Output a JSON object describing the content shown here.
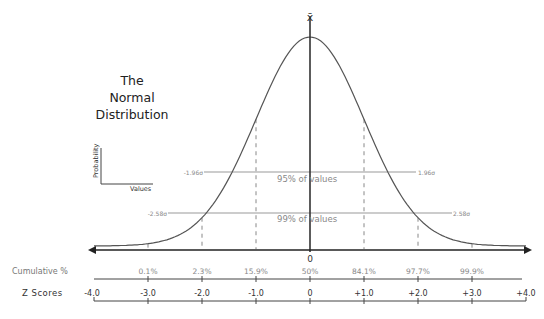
{
  "title": {
    "line1": "The",
    "line2": "Normal",
    "line3": "Distribution"
  },
  "legend": {
    "y_label": "Probability",
    "x_label": "Values"
  },
  "mean_symbol": "x̄",
  "center_label": "0",
  "intervals": {
    "inner": {
      "label": "95% of values",
      "left": "-1.96σ",
      "right": "1.96σ"
    },
    "outer": {
      "label": "99% of values",
      "left": "-2.58σ",
      "right": "2.58σ"
    }
  },
  "rows": {
    "cumulative_label": "Cumulative %",
    "z_label": "Z Scores"
  },
  "chart_data": {
    "type": "line",
    "title": "The Normal Distribution",
    "xlabel": "Values",
    "ylabel": "Probability",
    "x": [
      -4.0,
      -3.0,
      -2.0,
      -1.0,
      0,
      1.0,
      2.0,
      3.0,
      4.0
    ],
    "z_score_labels": [
      "-4.0",
      "-3.0",
      "-2.0",
      "-1.0",
      "0",
      "+1.0",
      "+2.0",
      "+3.0",
      "+4.0"
    ],
    "cumulative_percent": {
      "z": [
        -3.0,
        -2.0,
        -1.0,
        0,
        1.0,
        2.0,
        3.0
      ],
      "labels": [
        "0.1%",
        "2.3%",
        "15.9%",
        "50%",
        "84.1%",
        "97.7%",
        "99.9%"
      ]
    },
    "annotations": [
      {
        "text": "95% of values",
        "range": [
          "-1.96σ",
          "1.96σ"
        ]
      },
      {
        "text": "99% of values",
        "range": [
          "-2.58σ",
          "2.58σ"
        ]
      },
      {
        "text": "x̄",
        "at": 0
      }
    ],
    "grid": false,
    "curve": "standard normal bell curve"
  }
}
